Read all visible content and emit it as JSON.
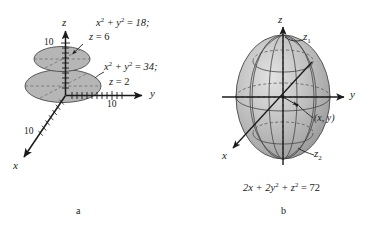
{
  "figure": {
    "background_color": "#ffffff",
    "ink_color": "#1a1a1a",
    "surface_fill": "#b6b6b6",
    "surface_stroke": "#4a4a4a",
    "panels": [
      {
        "id": "panel-a",
        "caption": "a",
        "axes": [
          {
            "name": "z",
            "label": "z",
            "tick_label": "10"
          },
          {
            "name": "y",
            "label": "y",
            "tick_label": "10"
          },
          {
            "name": "x",
            "label": "x",
            "tick_label": "10"
          }
        ],
        "annotations": [
          {
            "id": "upper-disk",
            "equation_line1": "x² + y² = 18;",
            "equation_line2": "z = 6"
          },
          {
            "id": "lower-disk",
            "equation_line1": "x² + y² = 34;",
            "equation_line2": "z = 2"
          }
        ]
      },
      {
        "id": "panel-b",
        "caption": "b",
        "axes": [
          {
            "name": "z",
            "label": "z"
          },
          {
            "name": "y",
            "label": "y"
          },
          {
            "name": "x",
            "label": "x"
          }
        ],
        "annotations": [
          {
            "id": "top-intercept",
            "label": "z₁"
          },
          {
            "id": "bottom-intercept",
            "label": "z₂"
          },
          {
            "id": "point-xy",
            "label": "(x, y)"
          }
        ],
        "equation": "2x + 2y² + z² = 72"
      }
    ]
  },
  "labels": {
    "a_z_axis": "z",
    "a_y_axis": "y",
    "a_x_axis": "x",
    "a_z_tick": "10",
    "a_y_tick": "10",
    "a_x_tick": "10",
    "a_eq1_num": "18;",
    "a_eq1_cond": "= 6",
    "a_eq2_num": "34;",
    "a_eq2_cond": "= 2",
    "b_z_axis": "z",
    "b_y_axis": "y",
    "b_x_axis": "x",
    "b_z1": "z",
    "b_z1_sub": "1",
    "b_z2": "z",
    "b_z2_sub": "2",
    "b_point": "(x, y)",
    "b_eq_rhs": "= 72",
    "caption_a": "a",
    "caption_b": "b"
  }
}
